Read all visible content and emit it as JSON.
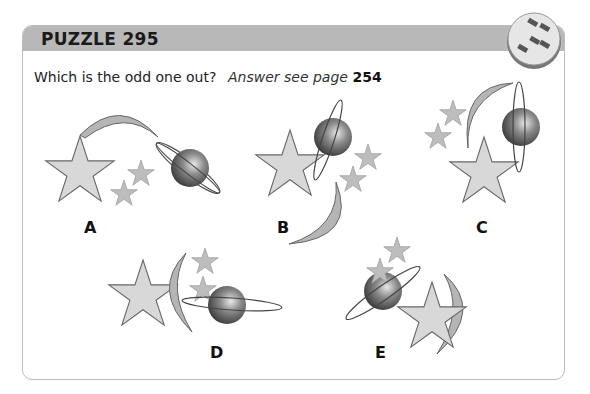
{
  "header": {
    "title": "PUZZLE 295",
    "badge_icon": "puzzle-blocks-icon"
  },
  "question": "Which is the odd one out?",
  "answer": {
    "prefix": "Answer see page",
    "page": "254"
  },
  "options": [
    {
      "label": "A",
      "elements": [
        "large-star",
        "two-small-stars",
        "crescent-moon",
        "ringed-planet"
      ]
    },
    {
      "label": "B",
      "elements": [
        "large-star",
        "two-small-stars",
        "crescent-moon",
        "ringed-planet"
      ]
    },
    {
      "label": "C",
      "elements": [
        "large-star",
        "two-small-stars",
        "crescent-moon",
        "ringed-planet"
      ]
    },
    {
      "label": "D",
      "elements": [
        "large-star",
        "two-small-stars",
        "crescent-moon",
        "ringed-planet"
      ]
    },
    {
      "label": "E",
      "elements": [
        "large-star",
        "two-small-stars",
        "crescent-moon",
        "ringed-planet"
      ]
    }
  ],
  "colors": {
    "header_bg": "#b8b8b8",
    "star_fill": "#d8d8d8",
    "small_star_fill": "#bdbdbd",
    "moon_fill": "#b5b5b5",
    "planet_dark": "#3a3a3a"
  }
}
